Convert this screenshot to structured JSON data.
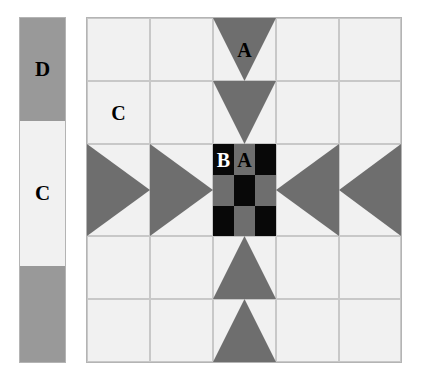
{
  "diagram": {
    "colors": {
      "background": "#ffffff",
      "light_fabric": "#f1f1f1",
      "medium_gray_fabric": "#6e6e6e",
      "dark_gray_fabric": "#999999",
      "black_fabric": "#080808",
      "grid_line": "#c8c8c8",
      "outline": "#b4b4b4"
    },
    "legend": {
      "name": "fabric-key-strip",
      "cells": [
        {
          "label": "D",
          "fabric": "dark-gray",
          "label_color": "#000000"
        },
        {
          "label": "C",
          "fabric": "light",
          "label_color": "#000000"
        },
        {
          "label": "",
          "fabric": "dark-gray",
          "label_color": "#000000"
        }
      ]
    },
    "block": {
      "name": "quilt-block",
      "grid_columns": 5,
      "grid_rows": 5,
      "labels": [
        {
          "text": "A",
          "piece": "flying-geese-triangle",
          "color": "#000000",
          "position": "top-center"
        },
        {
          "text": "C",
          "piece": "corner-square",
          "color": "#000000",
          "position": "top-left"
        },
        {
          "text": "B",
          "piece": "black-square",
          "color": "#ffffff",
          "position": "center-left"
        },
        {
          "text": "A",
          "piece": "gray-square",
          "color": "#000000",
          "position": "center-middle"
        }
      ],
      "units": [
        {
          "row": 1,
          "col": 1,
          "type": "square",
          "fabric": "light"
        },
        {
          "row": 1,
          "col": 2,
          "type": "square",
          "fabric": "light"
        },
        {
          "row": 1,
          "col": 3,
          "type": "flying-geese",
          "fabric": "medium-gray",
          "point": "down"
        },
        {
          "row": 1,
          "col": 4,
          "type": "square",
          "fabric": "light"
        },
        {
          "row": 1,
          "col": 5,
          "type": "square",
          "fabric": "light"
        },
        {
          "row": 2,
          "col": 1,
          "type": "square",
          "fabric": "light"
        },
        {
          "row": 2,
          "col": 2,
          "type": "square",
          "fabric": "light"
        },
        {
          "row": 2,
          "col": 3,
          "type": "flying-geese",
          "fabric": "medium-gray",
          "point": "down"
        },
        {
          "row": 2,
          "col": 4,
          "type": "square",
          "fabric": "light"
        },
        {
          "row": 2,
          "col": 5,
          "type": "square",
          "fabric": "light"
        },
        {
          "row": 3,
          "col": 1,
          "type": "flying-geese",
          "fabric": "medium-gray",
          "point": "right"
        },
        {
          "row": 3,
          "col": 2,
          "type": "flying-geese",
          "fabric": "medium-gray",
          "point": "right"
        },
        {
          "row": 3,
          "col": 3,
          "type": "nine-patch",
          "fabric": "black-and-gray-checkerboard"
        },
        {
          "row": 3,
          "col": 4,
          "type": "flying-geese",
          "fabric": "medium-gray",
          "point": "left"
        },
        {
          "row": 3,
          "col": 5,
          "type": "flying-geese",
          "fabric": "medium-gray",
          "point": "left"
        },
        {
          "row": 4,
          "col": 1,
          "type": "square",
          "fabric": "light"
        },
        {
          "row": 4,
          "col": 2,
          "type": "square",
          "fabric": "light"
        },
        {
          "row": 4,
          "col": 3,
          "type": "flying-geese",
          "fabric": "medium-gray",
          "point": "up"
        },
        {
          "row": 4,
          "col": 4,
          "type": "square",
          "fabric": "light"
        },
        {
          "row": 4,
          "col": 5,
          "type": "square",
          "fabric": "light"
        },
        {
          "row": 5,
          "col": 1,
          "type": "square",
          "fabric": "light"
        },
        {
          "row": 5,
          "col": 2,
          "type": "square",
          "fabric": "light"
        },
        {
          "row": 5,
          "col": 3,
          "type": "flying-geese",
          "fabric": "medium-gray",
          "point": "up"
        },
        {
          "row": 5,
          "col": 4,
          "type": "square",
          "fabric": "light"
        },
        {
          "row": 5,
          "col": 5,
          "type": "square",
          "fabric": "light"
        }
      ],
      "center_nine_patch": {
        "name": "nine-patch-center",
        "rows": [
          [
            "black",
            "gray",
            "black"
          ],
          [
            "gray",
            "black",
            "gray"
          ],
          [
            "black",
            "gray",
            "black"
          ]
        ]
      }
    }
  }
}
